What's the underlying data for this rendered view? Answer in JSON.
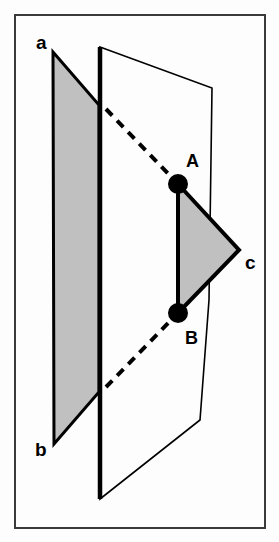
{
  "figure": {
    "frame": {
      "x": 15,
      "y": 15,
      "width": 250,
      "height": 513,
      "stroke_color": "#3a3a3a",
      "stroke_width": 2,
      "fill_color": "#fdfdfd"
    },
    "colors": {
      "outline": "#000000",
      "plane_fill_shaded": "#c0c0c0",
      "plane_fill_clear": "#fdfdfd",
      "triangle_fill": "#c0c0c0",
      "point_fill": "#000000",
      "dashed_line": "#000000",
      "background": "#fdfdfd"
    },
    "planes": [
      {
        "name": "shaded-plane",
        "label_top": "a",
        "label_bottom": "b",
        "fill": "#c0c0c0",
        "points": "53,52 99,105 99,392 54,444",
        "stroke_width": 3
      },
      {
        "name": "clear-plane",
        "fill": "#fdfdfd",
        "points": "100,47 212,88 209,300 200,420 100,499",
        "stroke_width": 1.6
      }
    ],
    "heavy_edge": {
      "name": "plane-intersection-edge",
      "x1": 100,
      "y1": 47,
      "x2": 100,
      "y2": 499,
      "stroke_width": 4.5
    },
    "triangle": {
      "name": "triangle-abc",
      "fill": "#c0c0c0",
      "points": "178,184 239,250 178,313",
      "stroke_width": 4
    },
    "dashed_lines": [
      {
        "name": "dashed-line-upper",
        "x1": 106,
        "y1": 109,
        "x2": 178,
        "y2": 184,
        "dash": "9 7",
        "stroke_width": 4
      },
      {
        "name": "dashed-line-lower",
        "x1": 106,
        "y1": 387,
        "x2": 178,
        "y2": 313,
        "dash": "9 7",
        "stroke_width": 4
      }
    ],
    "points": [
      {
        "name": "point-A",
        "label": "A",
        "cx": 178,
        "cy": 184,
        "r": 10,
        "label_x": 186,
        "label_y": 167
      },
      {
        "name": "point-B",
        "label": "B",
        "cx": 178,
        "cy": 313,
        "r": 10,
        "label_x": 185,
        "label_y": 344
      }
    ],
    "vertex_labels": [
      {
        "name": "vertex-label-a",
        "text": "a",
        "x": 36,
        "y": 49
      },
      {
        "name": "vertex-label-b",
        "text": "b",
        "x": 35,
        "y": 456
      },
      {
        "name": "vertex-label-c",
        "text": "c",
        "x": 245,
        "y": 269
      }
    ]
  }
}
